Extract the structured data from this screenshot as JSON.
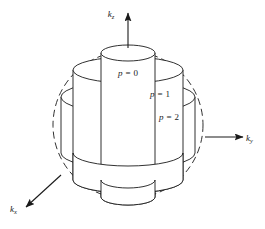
{
  "figure": {
    "background_color": "#ffffff",
    "stroke_color": "#1a1a1a",
    "width": 265,
    "height": 229
  },
  "axes": [
    {
      "id": "kz",
      "symbol": "k",
      "subscript": "z",
      "label": "k_z",
      "direction": "up",
      "arrow_from": [
        128,
        48
      ],
      "arrow_to": [
        128,
        13
      ],
      "label_position": [
        111,
        17
      ]
    },
    {
      "id": "ky",
      "symbol": "k",
      "subscript": "y",
      "label": "k_y",
      "direction": "right",
      "arrow_from": [
        205,
        137
      ],
      "arrow_to": [
        243,
        137
      ],
      "label_position": [
        246,
        141
      ]
    },
    {
      "id": "kx",
      "symbol": "k",
      "subscript": "x",
      "label": "k_x",
      "direction": "down-left",
      "arrow_from": [
        61,
        175
      ],
      "arrow_to": [
        26,
        207
      ],
      "label_position": [
        10,
        212
      ]
    }
  ],
  "sphere": {
    "name": "fermi-sphere",
    "style": "dashed",
    "center": [
      128,
      125
    ],
    "radius_x": 75,
    "radius_y": 74,
    "dash_pattern": "7 4"
  },
  "cylinders": [
    {
      "id": "p0",
      "label": "p = 0",
      "label_text_symbol": "p",
      "label_text_value": "0",
      "radius_x": 27,
      "radius_y": 8,
      "half_height": 72,
      "label_position": [
        128,
        76
      ]
    },
    {
      "id": "p1",
      "label": "p = 1",
      "label_text_symbol": "p",
      "label_text_value": "1",
      "radius_x": 55,
      "radius_y": 13,
      "half_height": 55,
      "label_position": [
        160,
        97
      ]
    },
    {
      "id": "p2",
      "label": "p = 2",
      "label_text_symbol": "p",
      "label_text_value": "2",
      "radius_x": 67,
      "radius_y": 16,
      "half_height": 28,
      "label_position": [
        169,
        120
      ]
    }
  ],
  "equals_sign": "=",
  "center": [
    128,
    125
  ]
}
